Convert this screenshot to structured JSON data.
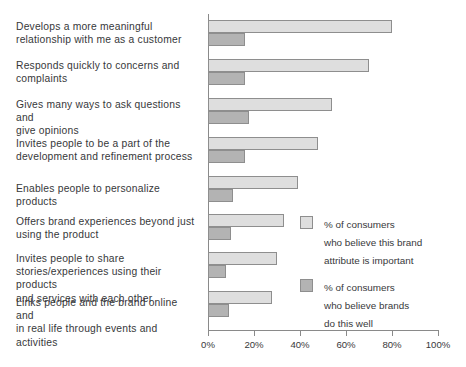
{
  "chart_data": {
    "type": "bar",
    "orientation": "horizontal",
    "title": "",
    "xlabel": "",
    "ylabel": "",
    "xlim": [
      0,
      100
    ],
    "xticks": [
      "0%",
      "20%",
      "40%",
      "60%",
      "80%",
      "100%"
    ],
    "xtick_values": [
      0,
      20,
      40,
      60,
      80,
      100
    ],
    "grid": false,
    "legend_position": "middle-right",
    "categories": [
      "Develops a more meaningful\nrelationship with me as a customer",
      "Responds quickly to concerns and\ncomplaints",
      "Gives many ways to ask questions and\ngive opinions",
      "Invites people to be a part of the\ndevelopment and refinement process",
      "Enables people to personalize products",
      "Offers brand experiences beyond just\nusing the product",
      "Invites people to share\nstories/experiences using their products\nand services with each other",
      "Links people and the brand online and\nin real life through events and activities"
    ],
    "series": [
      {
        "name": "% of consumers\nwho believe this brand\nattribute is important",
        "color": "#dedede",
        "values": [
          80,
          70,
          54,
          48,
          39,
          33,
          30,
          28
        ]
      },
      {
        "name": "% of consumers\nwho believe brands\ndo this well",
        "color": "#b3b3b3",
        "values": [
          16,
          16,
          18,
          16,
          11,
          10,
          8,
          9
        ]
      }
    ]
  },
  "legend": {
    "entries": [
      {
        "label": "% of consumers\nwho believe this brand\nattribute is important"
      },
      {
        "label": "% of consumers\nwho believe brands\ndo this well"
      }
    ]
  },
  "colors": {
    "important": "#dedede",
    "do_this_well": "#b3b3b3",
    "axis": "#8a8a8a",
    "text": "#37383a",
    "background": "#ffffff"
  }
}
